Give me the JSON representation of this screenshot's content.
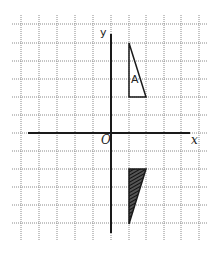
{
  "diagram": {
    "type": "coordinate-grid-reflection",
    "grid": {
      "x_lines": [
        21,
        39,
        57,
        75,
        93,
        111,
        129,
        146,
        164,
        181,
        199
      ],
      "y_lines": [
        24,
        43,
        61,
        79,
        97,
        115,
        133,
        151,
        169,
        187,
        205,
        223
      ],
      "x_extent": [
        12,
        208
      ],
      "y_extent": [
        15,
        240
      ]
    },
    "axes": {
      "x_label": "x",
      "y_label": "y",
      "origin_label": "O"
    },
    "shapes": [
      {
        "id": "A",
        "label": "A",
        "grid_vertices": [
          [
            1,
            5
          ],
          [
            1,
            2
          ],
          [
            2,
            2
          ]
        ],
        "fill": "none"
      },
      {
        "id": "image",
        "label": "",
        "grid_vertices": [
          [
            1,
            -2
          ],
          [
            2,
            -2
          ],
          [
            1,
            -5
          ]
        ],
        "fill": "hatched"
      }
    ]
  }
}
